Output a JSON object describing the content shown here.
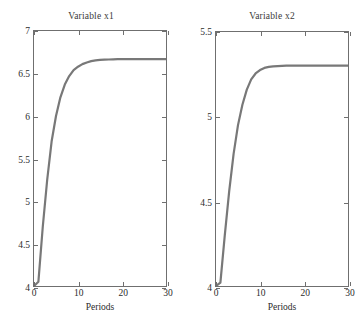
{
  "figure": {
    "background": "#ffffff",
    "curve_color": "#787878",
    "axis_color": "#6f6f6f"
  },
  "chart_data": [
    {
      "type": "line",
      "title": "Variable x1",
      "xlabel": "Periods",
      "ylabel": "",
      "xlim": [
        0,
        30
      ],
      "ylim": [
        4,
        7
      ],
      "xticks": [
        0,
        10,
        20,
        30
      ],
      "xticklabels": [
        "0",
        "10",
        "20",
        "30"
      ],
      "yticks": [
        4,
        4.5,
        5,
        5.5,
        6,
        6.5,
        7
      ],
      "yticklabels": [
        "4",
        "4.5",
        "5",
        "5.5",
        "6",
        "6.5",
        "7"
      ],
      "grid": false,
      "legend": false,
      "series": [
        {
          "name": "x1",
          "color": "#787878",
          "x": [
            0,
            1,
            2,
            3,
            4,
            5,
            6,
            7,
            8,
            9,
            10,
            11,
            12,
            13,
            14,
            15,
            16,
            17,
            18,
            19,
            20,
            21,
            22,
            23,
            24,
            25,
            26,
            27,
            28,
            29,
            30
          ],
          "values": [
            4.0,
            4.05,
            4.7,
            5.25,
            5.7,
            6.0,
            6.22,
            6.37,
            6.47,
            6.54,
            6.58,
            6.61,
            6.63,
            6.645,
            6.655,
            6.66,
            6.663,
            6.665,
            6.667,
            6.668,
            6.668,
            6.669,
            6.669,
            6.669,
            6.67,
            6.67,
            6.67,
            6.67,
            6.67,
            6.67,
            6.67
          ]
        }
      ]
    },
    {
      "type": "line",
      "title": "Variable x2",
      "xlabel": "Periods",
      "ylabel": "",
      "xlim": [
        0,
        30
      ],
      "ylim": [
        4,
        5.5
      ],
      "xticks": [
        0,
        10,
        20,
        30
      ],
      "xticklabels": [
        "0",
        "10",
        "20",
        "30"
      ],
      "yticks": [
        4,
        4.5,
        5,
        5.5
      ],
      "yticklabels": [
        "4",
        "4.5",
        "5",
        "5.5"
      ],
      "grid": false,
      "legend": false,
      "series": [
        {
          "name": "x2",
          "color": "#787878",
          "x": [
            0,
            1,
            2,
            3,
            4,
            5,
            6,
            7,
            8,
            9,
            10,
            11,
            12,
            13,
            14,
            15,
            16,
            17,
            18,
            19,
            20,
            21,
            22,
            23,
            24,
            25,
            26,
            27,
            28,
            29,
            30
          ],
          "values": [
            4.0,
            4.02,
            4.3,
            4.56,
            4.78,
            4.95,
            5.07,
            5.16,
            5.22,
            5.255,
            5.275,
            5.288,
            5.294,
            5.297,
            5.299,
            5.3,
            5.301,
            5.301,
            5.302,
            5.302,
            5.302,
            5.302,
            5.302,
            5.302,
            5.302,
            5.302,
            5.302,
            5.302,
            5.302,
            5.302,
            5.302
          ]
        }
      ]
    }
  ]
}
